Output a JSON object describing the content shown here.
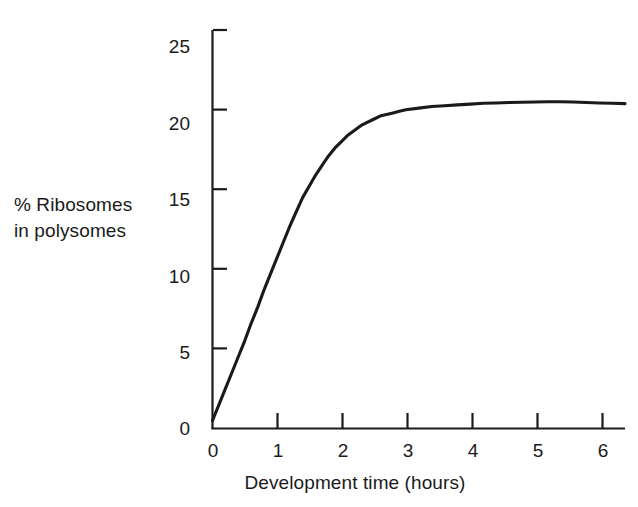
{
  "figure": {
    "background_color": "#ffffff",
    "line_color": "#1a1a1a",
    "axis_color": "#1a1a1a"
  },
  "axis": {
    "y_label_line1": "% Ribosomes",
    "y_label_line2": "in polysomes",
    "x_title": "Development time (hours)",
    "y_ticks": [
      "0",
      "5",
      "10",
      "15",
      "20",
      "25"
    ],
    "x_ticks": [
      "0",
      "1",
      "2",
      "3",
      "4",
      "5",
      "6"
    ]
  },
  "chart_data": {
    "type": "line",
    "title": "",
    "subtitle": "",
    "xlabel": "Development time (hours)",
    "ylabel": "% Ribosomes in polysomes",
    "xlim": [
      0,
      6.4
    ],
    "ylim": [
      0,
      25
    ],
    "xticks": [
      0,
      1,
      2,
      3,
      4,
      5,
      6
    ],
    "yticks": [
      0,
      5,
      10,
      15,
      20,
      25
    ],
    "grid": false,
    "legend": false,
    "legend_position": "none",
    "series": [
      {
        "name": "% Ribosomes in polysomes",
        "color": "#1a1a1a",
        "x": [
          0.0,
          0.1,
          0.2,
          0.3,
          0.4,
          0.5,
          0.6,
          0.7,
          0.8,
          0.9,
          1.0,
          1.1,
          1.2,
          1.3,
          1.4,
          1.5,
          1.6,
          1.7,
          1.8,
          1.9,
          2.0,
          2.1,
          2.2,
          2.3,
          2.4,
          2.5,
          2.6,
          2.7,
          2.8,
          2.9,
          3.0,
          3.2,
          3.4,
          3.6,
          3.8,
          4.0,
          4.2,
          4.4,
          4.6,
          4.8,
          5.0,
          5.2,
          5.4,
          5.6,
          5.8,
          6.0,
          6.2,
          6.4
        ],
        "y": [
          0.5,
          1.5,
          2.5,
          3.5,
          4.5,
          5.5,
          6.6,
          7.6,
          8.7,
          9.7,
          10.7,
          11.7,
          12.7,
          13.6,
          14.5,
          15.2,
          15.9,
          16.5,
          17.1,
          17.6,
          18.0,
          18.4,
          18.7,
          19.0,
          19.2,
          19.4,
          19.6,
          19.7,
          19.8,
          19.9,
          20.0,
          20.1,
          20.2,
          20.25,
          20.3,
          20.35,
          20.4,
          20.42,
          20.45,
          20.47,
          20.48,
          20.5,
          20.5,
          20.48,
          20.45,
          20.42,
          20.4,
          20.38
        ]
      }
    ],
    "annotations": []
  }
}
